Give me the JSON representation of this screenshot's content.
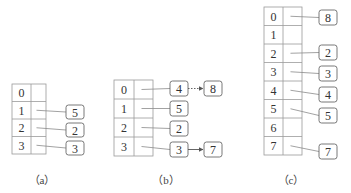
{
  "diagrams": [
    {
      "caption": "（a）",
      "table": {
        "x": 12,
        "y": 84,
        "index_w": 19,
        "ptr_w": 15,
        "row_h": 17.5
      },
      "rows": [
        "0",
        "1",
        "2",
        "3"
      ],
      "chains": [
        {
          "row": 1,
          "nodes": [
            "5"
          ]
        },
        {
          "row": 2,
          "nodes": [
            "2"
          ]
        },
        {
          "row": 3,
          "nodes": [
            "3"
          ]
        }
      ],
      "node_boxes": [
        {
          "label": "5",
          "x": 66,
          "y": 105,
          "w": 18,
          "h": 14,
          "from_row": 1
        },
        {
          "label": "2",
          "x": 66,
          "y": 123,
          "w": 18,
          "h": 14,
          "from_row": 2
        },
        {
          "label": "3",
          "x": 66,
          "y": 141,
          "w": 18,
          "h": 14,
          "from_row": 3
        }
      ],
      "links": [],
      "caption_pos": {
        "x": 42,
        "y": 184
      }
    },
    {
      "caption": "（b）",
      "table": {
        "x": 114,
        "y": 80,
        "index_w": 20,
        "ptr_w": 19,
        "row_h": 19
      },
      "rows": [
        "0",
        "1",
        "2",
        "3"
      ],
      "chains": [
        {
          "row": 0,
          "nodes": [
            "4",
            "8"
          ]
        },
        {
          "row": 1,
          "nodes": [
            "5"
          ]
        },
        {
          "row": 2,
          "nodes": [
            "2"
          ]
        },
        {
          "row": 3,
          "nodes": [
            "3",
            "7"
          ]
        }
      ],
      "node_boxes": [
        {
          "label": "4",
          "x": 170,
          "y": 81,
          "w": 18,
          "h": 15,
          "from_row": 0
        },
        {
          "label": "8",
          "x": 204,
          "y": 81,
          "w": 18,
          "h": 15
        },
        {
          "label": "5",
          "x": 170,
          "y": 101,
          "w": 18,
          "h": 15,
          "from_row": 1
        },
        {
          "label": "2",
          "x": 170,
          "y": 121,
          "w": 18,
          "h": 15,
          "from_row": 2
        },
        {
          "label": "3",
          "x": 170,
          "y": 142,
          "w": 18,
          "h": 15,
          "from_row": 3
        },
        {
          "label": "7",
          "x": 204,
          "y": 142,
          "w": 18,
          "h": 15
        }
      ],
      "links": [
        {
          "from": "4",
          "to": "8",
          "style": "dotted",
          "x1": 188,
          "y1": 88.5,
          "x2": 204,
          "y2": 88.5
        },
        {
          "from": "3",
          "to": "7",
          "style": "solid",
          "x1": 188,
          "y1": 149.5,
          "x2": 204,
          "y2": 149.5
        }
      ],
      "caption_pos": {
        "x": 166,
        "y": 184
      }
    },
    {
      "caption": "（c）",
      "table": {
        "x": 264,
        "y": 7,
        "index_w": 19,
        "ptr_w": 19,
        "row_h": 18.5
      },
      "rows": [
        "0",
        "1",
        "2",
        "3",
        "4",
        "5",
        "6",
        "7"
      ],
      "chains": [
        {
          "row": 0,
          "nodes": [
            "8"
          ]
        },
        {
          "row": 2,
          "nodes": [
            "2"
          ]
        },
        {
          "row": 3,
          "nodes": [
            "3"
          ]
        },
        {
          "row": 4,
          "nodes": [
            "4"
          ]
        },
        {
          "row": 5,
          "nodes": [
            "5"
          ]
        },
        {
          "row": 7,
          "nodes": [
            "7"
          ]
        }
      ],
      "node_boxes": [
        {
          "label": "8",
          "x": 319,
          "y": 10,
          "w": 18,
          "h": 15,
          "from_row": 0
        },
        {
          "label": "2",
          "x": 319,
          "y": 45,
          "w": 18,
          "h": 15,
          "from_row": 2
        },
        {
          "label": "3",
          "x": 319,
          "y": 66,
          "w": 18,
          "h": 15,
          "from_row": 3
        },
        {
          "label": "4",
          "x": 319,
          "y": 87,
          "w": 18,
          "h": 15,
          "from_row": 4
        },
        {
          "label": "5",
          "x": 319,
          "y": 108,
          "w": 18,
          "h": 15,
          "from_row": 5
        },
        {
          "label": "7",
          "x": 319,
          "y": 144,
          "w": 18,
          "h": 15,
          "from_row": 7
        }
      ],
      "links": [],
      "caption_pos": {
        "x": 291,
        "y": 184
      }
    }
  ],
  "colors": {
    "grid": "#9a9a9a",
    "pointer": "#8a8a8a",
    "node_border": "#6a6a6a",
    "text": "#333333"
  }
}
